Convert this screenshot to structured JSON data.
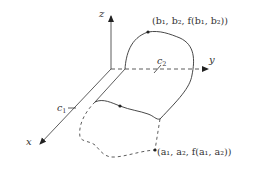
{
  "diagram": {
    "axes": {
      "x_label": "x",
      "y_label": "y",
      "z_label": "z"
    },
    "labels": {
      "c1": "c",
      "c1_sub": "1",
      "c2": "c",
      "c2_sub": "2",
      "point_b": "(b₁, b₂, f(b₁, b₂))",
      "point_a": "(a₁, a₂, f(a₁, a₂))"
    },
    "colors": {
      "line": "#333333",
      "background": "#ffffff"
    }
  }
}
